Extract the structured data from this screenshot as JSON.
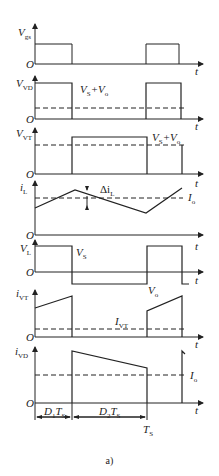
{
  "figure": {
    "caption": "a)",
    "time_axis_label": "t",
    "origin_label": "O",
    "panels": [
      {
        "id": "vgs",
        "ylabel": "V",
        "ylabel_sub": "gs"
      },
      {
        "id": "vvd",
        "ylabel": "V",
        "ylabel_sub": "VD",
        "annotation": "V",
        "annotation_sub1": "S",
        "annotation_mid": "+V",
        "annotation_sub2": "o"
      },
      {
        "id": "vvt",
        "ylabel": "V",
        "ylabel_sub": "VT",
        "annotation": "V",
        "annotation_sub1": "S",
        "annotation_mid": "+V",
        "annotation_sub2": "o"
      },
      {
        "id": "il",
        "ylabel": "i",
        "ylabel_sub": "L",
        "ripple_label": "Δi",
        "ripple_sub": "L",
        "avg_label": "I",
        "avg_sub": "o"
      },
      {
        "id": "vl",
        "ylabel": "V",
        "ylabel_sub": "L",
        "high_label": "V",
        "high_sub": "S",
        "low_label": "V",
        "low_sub": "o"
      },
      {
        "id": "ivt",
        "ylabel": "i",
        "ylabel_sub": "VT",
        "avg_label": "I",
        "avg_sub": "VT"
      },
      {
        "id": "ivd",
        "ylabel": "i",
        "ylabel_sub": "VD",
        "avg_label": "I",
        "avg_sub": "o"
      }
    ],
    "dimensions": {
      "d1": "D",
      "d1_sub": "1",
      "d1_t": "T",
      "d1_t_sub": "S",
      "d2": "D",
      "d2_sub": "2",
      "d2_t": "T",
      "d2_t_sub": "S",
      "ts": "T",
      "ts_sub": "S"
    }
  }
}
